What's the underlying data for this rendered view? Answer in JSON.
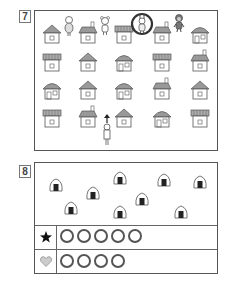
{
  "questions": [
    {
      "number": "7",
      "description": "Grid of houses with characters on the top row; a child stands at the bottom with an arrow pointing up; one character on the top row is circled.",
      "top_characters": [
        {
          "name": "girl",
          "position": "between house 1 and house 2"
        },
        {
          "name": "bear",
          "position": "between house 2 and house 3"
        },
        {
          "name": "rabbit",
          "position": "between house 3 and house 4",
          "circled": true
        },
        {
          "name": "monkey",
          "position": "between house 4 and house 5"
        }
      ],
      "house_rows": 4,
      "house_cols": 5,
      "houses": [
        [
          "triangle-roof",
          "chimney-roof",
          "flat-roof",
          "chimney-roof",
          "dome-roof"
        ],
        [
          "flat-roof",
          "triangle-roof",
          "dome-roof",
          "flat-roof",
          "chimney-roof"
        ],
        [
          "dome-roof",
          "triangle-roof",
          "dome-roof",
          "chimney-roof",
          "triangle-roof"
        ],
        [
          "flat-roof",
          "chimney-roof",
          "triangle-roof",
          "dome-roof",
          "flat-roof"
        ]
      ],
      "walker": {
        "name": "boy",
        "arrow": "up"
      },
      "circle_color": "#333333"
    },
    {
      "number": "8",
      "description": "Rice balls (onigiri) scattered in a box; answer rows with circles next to a star and a heart.",
      "onigiri_count": 9,
      "answer_rows": [
        {
          "symbol": "star",
          "symbol_color": "#111111",
          "circles": 5
        },
        {
          "symbol": "heart",
          "symbol_color": "#cccccc",
          "circles": 4
        }
      ]
    }
  ]
}
